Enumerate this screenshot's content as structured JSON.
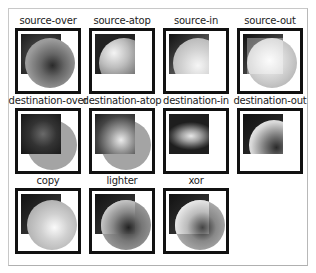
{
  "panel": {
    "title": "Canvas globalCompositeOperation examples",
    "operations": [
      {
        "label": "source-over"
      },
      {
        "label": "source-atop"
      },
      {
        "label": "source-in"
      },
      {
        "label": "source-out"
      },
      {
        "label": "destination-over"
      },
      {
        "label": "destination-atop"
      },
      {
        "label": "destination-in"
      },
      {
        "label": "destination-out"
      },
      {
        "label": "copy"
      },
      {
        "label": "lighter"
      },
      {
        "label": "xor"
      }
    ]
  },
  "colors": {
    "box_border": "#111111",
    "panel_border": "#c8c8c8",
    "background": "#ffffff"
  }
}
